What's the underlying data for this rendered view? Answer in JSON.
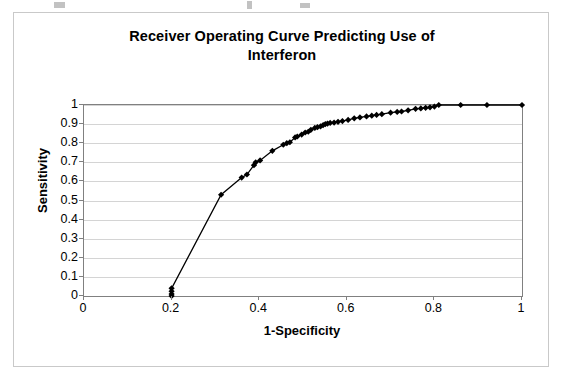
{
  "page": {
    "background_color": "#ffffff",
    "width": 564,
    "height": 381
  },
  "chart_frame": {
    "border_color": "#c9c9c9",
    "plot_border_color": "#808080",
    "gridline_color": "#d4d4d4"
  },
  "chart_data": {
    "type": "line",
    "title": "Receiver Operating Curve Predicting Use of Interferon",
    "title_line_1": "Receiver Operating Curve Predicting Use of",
    "title_line_2": "Interferon",
    "xlabel": "1-Specificity",
    "ylabel": "Sensitivity",
    "xlim": [
      0,
      1
    ],
    "ylim": [
      0,
      1
    ],
    "grid": true,
    "grid_axis": "y",
    "legend": false,
    "legend_position": "none",
    "marker": "diamond",
    "marker_color": "#000000",
    "line_color": "#000000",
    "xticks": [
      0,
      0.2,
      0.4,
      0.6,
      0.8,
      1
    ],
    "xtick_labels": [
      "0",
      "0.2",
      "0.4",
      "0.6",
      "0.8",
      "1"
    ],
    "yticks": [
      0,
      0.1,
      0.2,
      0.3,
      0.4,
      0.5,
      0.6,
      0.7,
      0.8,
      0.9,
      1
    ],
    "ytick_labels": [
      "0",
      "0.1",
      "0.2",
      "0.3",
      "0.4",
      "0.5",
      "0.6",
      "0.7",
      "0.8",
      "0.9",
      "1"
    ],
    "series": [
      {
        "name": "ROC curve",
        "x": [
          0.2,
          0.2,
          0.2,
          0.2,
          0.313,
          0.36,
          0.372,
          0.388,
          0.392,
          0.402,
          0.43,
          0.455,
          0.463,
          0.47,
          0.482,
          0.487,
          0.497,
          0.505,
          0.512,
          0.518,
          0.527,
          0.533,
          0.54,
          0.546,
          0.551,
          0.556,
          0.562,
          0.571,
          0.58,
          0.59,
          0.603,
          0.617,
          0.63,
          0.645,
          0.657,
          0.668,
          0.68,
          0.7,
          0.715,
          0.725,
          0.74,
          0.757,
          0.769,
          0.78,
          0.79,
          0.8,
          0.81,
          0.86,
          0.92,
          1.0
        ],
        "y": [
          0.0,
          0.01,
          0.025,
          0.04,
          0.53,
          0.62,
          0.636,
          0.685,
          0.7,
          0.71,
          0.76,
          0.792,
          0.8,
          0.805,
          0.83,
          0.835,
          0.845,
          0.856,
          0.86,
          0.87,
          0.88,
          0.884,
          0.888,
          0.895,
          0.9,
          0.903,
          0.906,
          0.908,
          0.912,
          0.916,
          0.922,
          0.93,
          0.935,
          0.94,
          0.944,
          0.948,
          0.952,
          0.96,
          0.964,
          0.966,
          0.972,
          0.98,
          0.982,
          0.985,
          0.988,
          0.992,
          1.0,
          1.0,
          1.0,
          1.0
        ]
      }
    ]
  }
}
